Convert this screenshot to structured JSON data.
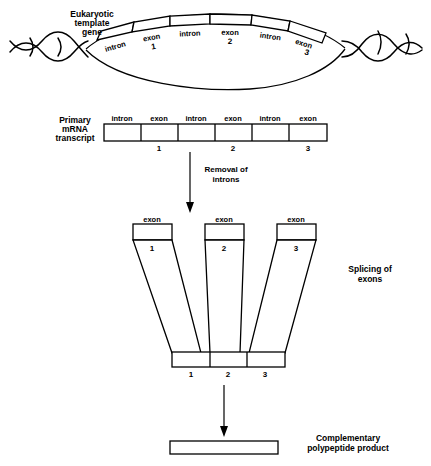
{
  "diagram": {
    "background": "#ffffff",
    "ink": "#000000"
  },
  "gene": {
    "label_line1": "Eukaryotic",
    "label_line2": "template",
    "label_line3": "gene",
    "segments": [
      {
        "name": "intron",
        "number": ""
      },
      {
        "name": "exon",
        "number": "1"
      },
      {
        "name": "intron",
        "number": ""
      },
      {
        "name": "exon",
        "number": "2"
      },
      {
        "name": "intron",
        "number": ""
      },
      {
        "name": "exon",
        "number": "3"
      }
    ]
  },
  "transcript": {
    "label_line1": "Primary",
    "label_line2": "mRNA",
    "label_line3": "transcript",
    "segments": [
      {
        "name": "intron",
        "number": ""
      },
      {
        "name": "exon",
        "number": "1"
      },
      {
        "name": "intron",
        "number": ""
      },
      {
        "name": "exon",
        "number": "2"
      },
      {
        "name": "intron",
        "number": ""
      },
      {
        "name": "exon",
        "number": "3"
      }
    ]
  },
  "step_removal": {
    "label_line1": "Removal of",
    "label_line2": "introns"
  },
  "splicing": {
    "label_line1": "Splicing of",
    "label_line2": "exons",
    "exons": [
      {
        "name": "exon",
        "number": "1"
      },
      {
        "name": "exon",
        "number": "2"
      },
      {
        "name": "exon",
        "number": "3"
      }
    ],
    "spliced_segments": [
      {
        "number": "1"
      },
      {
        "number": "2"
      },
      {
        "number": "3"
      }
    ]
  },
  "product": {
    "label_line1": "Complementary",
    "label_line2": "polypeptide product"
  }
}
